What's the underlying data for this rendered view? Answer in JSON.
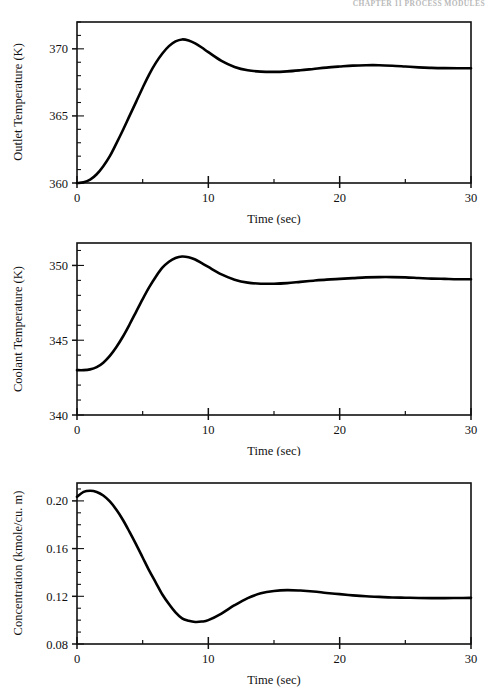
{
  "page": {
    "running_head": "CHAPTER 11   PROCESS MODULES",
    "background": "#ffffff",
    "ink": "#000000"
  },
  "figure": {
    "shared_xlabel": "Time (sec)",
    "xlim": [
      0,
      30
    ],
    "x_major_ticks": [
      0,
      10,
      20,
      30
    ],
    "x_minor_step": 5,
    "x_tick_labels": [
      "0",
      "10",
      "20",
      "30"
    ]
  },
  "chart_data": [
    {
      "id": "outlet-temperature",
      "type": "line",
      "title": "",
      "xlabel": "Time (sec)",
      "ylabel": "Outlet Temperature (K)",
      "xlim": [
        0,
        30
      ],
      "ylim": [
        360,
        372
      ],
      "y_major_ticks": [
        360,
        365,
        370
      ],
      "y_tick_labels": [
        "360",
        "365",
        "370"
      ],
      "y_minor_step": 1,
      "grid": false,
      "legend": "none",
      "series": [
        {
          "name": "Outlet Temperature",
          "x": [
            0,
            0.5,
            1,
            1.5,
            2,
            2.5,
            3,
            3.5,
            4,
            4.5,
            5,
            5.5,
            6,
            6.5,
            7,
            7.5,
            8,
            8.5,
            9,
            9.5,
            10,
            11,
            12,
            13,
            14,
            15,
            16,
            17,
            18,
            19,
            20,
            21,
            22,
            23,
            24,
            25,
            26,
            27,
            28,
            29,
            30
          ],
          "values": [
            360.0,
            360.05,
            360.25,
            360.65,
            361.25,
            362.0,
            362.95,
            363.95,
            365.0,
            366.05,
            367.1,
            368.1,
            368.95,
            369.65,
            370.2,
            370.55,
            370.7,
            370.62,
            370.4,
            370.1,
            369.75,
            369.1,
            368.65,
            368.4,
            368.3,
            368.28,
            368.32,
            368.4,
            368.5,
            368.6,
            368.68,
            368.75,
            368.78,
            368.78,
            368.74,
            368.68,
            368.62,
            368.58,
            368.56,
            368.55,
            368.55
          ]
        }
      ]
    },
    {
      "id": "coolant-temperature",
      "type": "line",
      "title": "",
      "xlabel": "Time (sec)",
      "ylabel": "Coolant Temperature (K)",
      "xlim": [
        0,
        30
      ],
      "ylim": [
        340,
        351.5
      ],
      "y_major_ticks": [
        340,
        345,
        350
      ],
      "y_tick_labels": [
        "340",
        "345",
        "350"
      ],
      "y_minor_step": 1,
      "grid": false,
      "legend": "none",
      "series": [
        {
          "name": "Coolant Temperature",
          "x": [
            0,
            0.5,
            1,
            1.5,
            2,
            2.5,
            3,
            3.5,
            4,
            4.5,
            5,
            5.5,
            6,
            6.5,
            7,
            7.5,
            8,
            8.5,
            9,
            9.5,
            10,
            11,
            12,
            13,
            14,
            15,
            16,
            17,
            18,
            19,
            20,
            21,
            22,
            23,
            24,
            25,
            26,
            27,
            28,
            29,
            30
          ],
          "values": [
            343.0,
            343.0,
            343.05,
            343.2,
            343.5,
            343.95,
            344.55,
            345.25,
            346.05,
            346.9,
            347.75,
            348.55,
            349.25,
            349.85,
            350.25,
            350.5,
            350.6,
            350.55,
            350.4,
            350.15,
            349.9,
            349.4,
            349.05,
            348.85,
            348.78,
            348.78,
            348.82,
            348.9,
            348.98,
            349.05,
            349.1,
            349.15,
            349.2,
            349.22,
            349.22,
            349.2,
            349.16,
            349.12,
            349.1,
            349.08,
            349.08
          ]
        }
      ]
    },
    {
      "id": "concentration",
      "type": "line",
      "title": "",
      "xlabel": "Time (sec)",
      "ylabel": "Concentration (kmole/cu. m)",
      "xlim": [
        0,
        30
      ],
      "ylim": [
        0.08,
        0.215
      ],
      "y_major_ticks": [
        0.08,
        0.12,
        0.16,
        0.2
      ],
      "y_tick_labels": [
        "0.08",
        "0.12",
        "0.16",
        "0.20"
      ],
      "y_minor_step": 0.01,
      "grid": false,
      "legend": "none",
      "series": [
        {
          "name": "Concentration",
          "x": [
            0,
            0.5,
            1,
            1.5,
            2,
            2.5,
            3,
            3.5,
            4,
            4.5,
            5,
            5.5,
            6,
            6.5,
            7,
            7.5,
            8,
            8.5,
            9,
            9.5,
            10,
            11,
            12,
            13,
            14,
            15,
            16,
            17,
            18,
            19,
            20,
            21,
            22,
            23,
            24,
            25,
            26,
            27,
            28,
            29,
            30
          ],
          "values": [
            0.2035,
            0.2075,
            0.2085,
            0.2075,
            0.2045,
            0.1995,
            0.1925,
            0.184,
            0.174,
            0.1635,
            0.1525,
            0.1415,
            0.1315,
            0.1215,
            0.1135,
            0.1065,
            0.1015,
            0.0995,
            0.0985,
            0.0988,
            0.1,
            0.1055,
            0.1125,
            0.1185,
            0.1225,
            0.1245,
            0.1252,
            0.1248,
            0.124,
            0.1228,
            0.1218,
            0.1208,
            0.12,
            0.1195,
            0.119,
            0.1188,
            0.1186,
            0.1185,
            0.1185,
            0.1186,
            0.1187
          ]
        }
      ]
    }
  ]
}
